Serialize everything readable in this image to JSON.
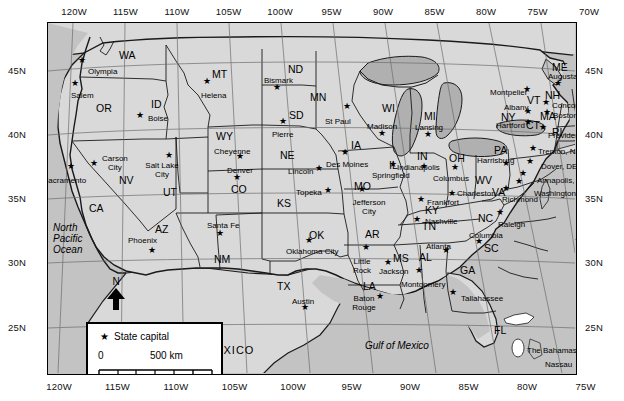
{
  "map": {
    "title": "United States state capitals map",
    "colors": {
      "land": "#d9d9d9",
      "ocean": "#c3c3c3",
      "lake": "#b0b0b0",
      "border": "#1a1a1a",
      "graticule": "#6b6b6b",
      "text": "#000000"
    },
    "axes": {
      "longitude_top": [
        "120W",
        "115W",
        "110W",
        "105W",
        "100W",
        "95W",
        "90W",
        "85W",
        "80W",
        "75W",
        "70W"
      ],
      "longitude_bottom": [
        "120W",
        "115W",
        "110W",
        "105W",
        "100W",
        "95W",
        "90W",
        "85W",
        "80W",
        "75W"
      ],
      "latitude_left": [
        "45N",
        "40N",
        "35N",
        "30N",
        "25N"
      ],
      "latitude_right": [
        "45N",
        "40N",
        "35N",
        "30N",
        "25N"
      ]
    },
    "legend": {
      "capital_label": "State capital",
      "capital_symbol": "star",
      "scale_top_start": "0",
      "scale_top_end": "500 km",
      "scale_bottom_start": "0",
      "scale_bottom_end": "500 m"
    },
    "north_arrow_label": "N",
    "water_labels": [
      {
        "name": "north-pacific-ocean",
        "text": "North\nPacific\nOcean",
        "x": 53,
        "y": 222
      },
      {
        "name": "north-atlantic-ocean",
        "text": "North\nAtlantic\nOcean",
        "x": 576,
        "y": 220
      },
      {
        "name": "gulf-of-mexico",
        "text": "Gulf of Mexico",
        "x": 365,
        "y": 341
      }
    ],
    "country_labels": [
      {
        "name": "mexico",
        "text": "MEXICO",
        "x": 205,
        "y": 345
      },
      {
        "name": "the-bahamas",
        "text": "The Bahamas",
        "x": 527,
        "y": 347
      },
      {
        "name": "nassau",
        "text": "Nassau",
        "x": 545,
        "y": 361
      }
    ],
    "state_abbreviations": [
      {
        "code": "WA",
        "x": 119,
        "y": 50
      },
      {
        "code": "OR",
        "x": 96,
        "y": 103
      },
      {
        "code": "ID",
        "x": 151,
        "y": 99
      },
      {
        "code": "MT",
        "x": 212,
        "y": 69
      },
      {
        "code": "ND",
        "x": 288,
        "y": 64
      },
      {
        "code": "SD",
        "x": 289,
        "y": 110
      },
      {
        "code": "NE",
        "x": 280,
        "y": 150
      },
      {
        "code": "WY",
        "x": 216,
        "y": 131
      },
      {
        "code": "NV",
        "x": 119,
        "y": 175
      },
      {
        "code": "UT",
        "x": 163,
        "y": 187
      },
      {
        "code": "CO",
        "x": 231,
        "y": 184
      },
      {
        "code": "KS",
        "x": 277,
        "y": 198
      },
      {
        "code": "CA",
        "x": 89,
        "y": 203
      },
      {
        "code": "AZ",
        "x": 155,
        "y": 224
      },
      {
        "code": "NM",
        "x": 214,
        "y": 254
      },
      {
        "code": "OK",
        "x": 309,
        "y": 230
      },
      {
        "code": "TX",
        "x": 277,
        "y": 281
      },
      {
        "code": "AR",
        "x": 365,
        "y": 229
      },
      {
        "code": "LA",
        "x": 363,
        "y": 281
      },
      {
        "code": "MS",
        "x": 393,
        "y": 253
      },
      {
        "code": "AL",
        "x": 419,
        "y": 252
      },
      {
        "code": "GA",
        "x": 460,
        "y": 265
      },
      {
        "code": "FL",
        "x": 494,
        "y": 325
      },
      {
        "code": "MO",
        "x": 354,
        "y": 181
      },
      {
        "code": "IA",
        "x": 351,
        "y": 140
      },
      {
        "code": "MN",
        "x": 310,
        "y": 92
      },
      {
        "code": "WI",
        "x": 382,
        "y": 103
      },
      {
        "code": "IL",
        "x": 389,
        "y": 160
      },
      {
        "code": "MI",
        "x": 424,
        "y": 111
      },
      {
        "code": "IN",
        "x": 417,
        "y": 151
      },
      {
        "code": "OH",
        "x": 449,
        "y": 153
      },
      {
        "code": "KY",
        "x": 425,
        "y": 205
      },
      {
        "code": "TN",
        "x": 422,
        "y": 221
      },
      {
        "code": "WV",
        "x": 475,
        "y": 175
      },
      {
        "code": "VA",
        "x": 492,
        "y": 187
      },
      {
        "code": "NC",
        "x": 478,
        "y": 213
      },
      {
        "code": "SC",
        "x": 484,
        "y": 243
      },
      {
        "code": "PA",
        "x": 494,
        "y": 145
      },
      {
        "code": "NY",
        "x": 501,
        "y": 112
      },
      {
        "code": "VT",
        "x": 527,
        "y": 95
      },
      {
        "code": "NH",
        "x": 545,
        "y": 90
      },
      {
        "code": "ME",
        "x": 552,
        "y": 62
      },
      {
        "code": "MA",
        "x": 540,
        "y": 111
      },
      {
        "code": "CT",
        "x": 526,
        "y": 120
      },
      {
        "code": "RI",
        "x": 552,
        "y": 127
      }
    ],
    "capitals": [
      {
        "name": "Olympia",
        "lx": 88,
        "ly": 68,
        "sx": 82,
        "sy": 60,
        "align": "left"
      },
      {
        "name": "Salem",
        "lx": 71,
        "ly": 92,
        "sx": 75,
        "sy": 83,
        "align": "left"
      },
      {
        "name": "Boise",
        "lx": 148,
        "ly": 115,
        "sx": 140,
        "sy": 115,
        "align": "left"
      },
      {
        "name": "Helena",
        "lx": 201,
        "ly": 92,
        "sx": 207,
        "sy": 81,
        "align": "left"
      },
      {
        "name": "Bismark",
        "lx": 264,
        "ly": 77,
        "sx": 277,
        "sy": 87,
        "align": "left"
      },
      {
        "name": "Pierre",
        "lx": 272,
        "ly": 131,
        "sx": 283,
        "sy": 121,
        "align": "left"
      },
      {
        "name": "Cheyenne",
        "lx": 214,
        "ly": 148,
        "sx": 240,
        "sy": 156,
        "align": "left"
      },
      {
        "name": "Denver",
        "lx": 227,
        "ly": 167,
        "sx": 237,
        "sy": 177,
        "align": "left"
      },
      {
        "name": "Salt Lake\nCity",
        "lx": 162,
        "ly": 162,
        "sx": 169,
        "sy": 155,
        "align": "center"
      },
      {
        "name": "Carson\nCity",
        "lx": 102,
        "ly": 155,
        "sx": 94,
        "sy": 163,
        "align": "left"
      },
      {
        "name": "Sacramento",
        "lx": 43,
        "ly": 177,
        "sx": 71,
        "sy": 166,
        "align": "left"
      },
      {
        "name": "Phoenix",
        "lx": 128,
        "ly": 237,
        "sx": 152,
        "sy": 250,
        "align": "left"
      },
      {
        "name": "Santa Fe",
        "lx": 207,
        "ly": 222,
        "sx": 220,
        "sy": 233,
        "align": "left"
      },
      {
        "name": "Lincoln",
        "lx": 288,
        "ly": 168,
        "sx": 319,
        "sy": 168,
        "align": "left"
      },
      {
        "name": "Topeka",
        "lx": 296,
        "ly": 189,
        "sx": 328,
        "sy": 190,
        "align": "left"
      },
      {
        "name": "Oklahoma City",
        "lx": 286,
        "ly": 248,
        "sx": 309,
        "sy": 240,
        "align": "left"
      },
      {
        "name": "Austin",
        "lx": 292,
        "ly": 298,
        "sx": 305,
        "sy": 307,
        "align": "left"
      },
      {
        "name": "St Paul",
        "lx": 325,
        "ly": 118,
        "sx": 347,
        "sy": 106,
        "align": "left"
      },
      {
        "name": "Des Moines",
        "lx": 326,
        "ly": 161,
        "sx": 345,
        "sy": 152,
        "align": "left"
      },
      {
        "name": "Jefferson\nCity",
        "lx": 369,
        "ly": 199,
        "sx": 362,
        "sy": 189,
        "align": "center"
      },
      {
        "name": "Little\nRock",
        "lx": 362,
        "ly": 258,
        "sx": 366,
        "sy": 247,
        "align": "center"
      },
      {
        "name": "Baton\nRouge",
        "lx": 364,
        "ly": 295,
        "sx": 380,
        "sy": 296,
        "align": "center"
      },
      {
        "name": "Jackson",
        "lx": 379,
        "ly": 268,
        "sx": 388,
        "sy": 262,
        "align": "left"
      },
      {
        "name": "Montgomery",
        "lx": 401,
        "ly": 281,
        "sx": 419,
        "sy": 270,
        "align": "left"
      },
      {
        "name": "Tallahassee",
        "lx": 461,
        "ly": 295,
        "sx": 453,
        "sy": 292,
        "align": "left"
      },
      {
        "name": "Atlanta",
        "lx": 426,
        "ly": 243,
        "sx": 446,
        "sy": 250,
        "align": "left"
      },
      {
        "name": "Columbia",
        "lx": 469,
        "ly": 232,
        "sx": 479,
        "sy": 241,
        "align": "left"
      },
      {
        "name": "Nashville",
        "lx": 425,
        "ly": 218,
        "sx": 417,
        "sy": 219,
        "align": "left"
      },
      {
        "name": "Frankfort",
        "lx": 427,
        "ly": 199,
        "sx": 421,
        "sy": 199,
        "align": "left"
      },
      {
        "name": "Madison",
        "lx": 367,
        "ly": 123,
        "sx": 382,
        "sy": 133,
        "align": "left"
      },
      {
        "name": "Lansing",
        "lx": 415,
        "ly": 124,
        "sx": 428,
        "sy": 134,
        "align": "left"
      },
      {
        "name": "Springfield",
        "lx": 372,
        "ly": 172,
        "sx": 393,
        "sy": 164,
        "align": "left"
      },
      {
        "name": "Indianapolis",
        "lx": 397,
        "ly": 164,
        "sx": 424,
        "sy": 166,
        "align": "left"
      },
      {
        "name": "Columbus",
        "lx": 433,
        "ly": 175,
        "sx": 455,
        "sy": 167,
        "align": "left"
      },
      {
        "name": "Charleston",
        "lx": 457,
        "ly": 190,
        "sx": 452,
        "sy": 193,
        "align": "left"
      },
      {
        "name": "Raleigh",
        "lx": 498,
        "ly": 221,
        "sx": 500,
        "sy": 212,
        "align": "left"
      },
      {
        "name": "Richmond",
        "lx": 502,
        "ly": 196,
        "sx": 506,
        "sy": 188,
        "align": "left"
      },
      {
        "name": "Harrisburg",
        "lx": 477,
        "ly": 157,
        "sx": 506,
        "sy": 163,
        "align": "left"
      },
      {
        "name": "Albany",
        "lx": 504,
        "ly": 104,
        "sx": 528,
        "sy": 111,
        "align": "left"
      },
      {
        "name": "Hartford",
        "lx": 496,
        "ly": 122,
        "sx": 528,
        "sy": 122,
        "align": "left"
      },
      {
        "name": "Montpelier",
        "lx": 490,
        "ly": 89,
        "sx": 527,
        "sy": 89,
        "align": "left"
      },
      {
        "name": "Concord",
        "lx": 552,
        "ly": 102,
        "sx": 546,
        "sy": 102,
        "align": "left"
      },
      {
        "name": "Boston",
        "lx": 553,
        "ly": 112,
        "sx": 547,
        "sy": 112,
        "align": "left"
      },
      {
        "name": "Augusta",
        "lx": 548,
        "ly": 73,
        "sx": 558,
        "sy": 83,
        "align": "left"
      },
      {
        "name": "Providence",
        "lx": 548,
        "ly": 132,
        "sx": 543,
        "sy": 127,
        "align": "left"
      },
      {
        "name": "Trenton, NJ",
        "lx": 538,
        "ly": 148,
        "sx": 533,
        "sy": 148,
        "align": "left"
      },
      {
        "name": "Dover, DE",
        "lx": 541,
        "ly": 163,
        "sx": 530,
        "sy": 161,
        "align": "left"
      },
      {
        "name": "Annapolis, MD",
        "lx": 537,
        "ly": 177,
        "sx": 523,
        "sy": 173,
        "align": "left"
      },
      {
        "name": "Washington, D.C",
        "lx": 534,
        "ly": 190,
        "sx": 519,
        "sy": 181,
        "align": "left"
      }
    ]
  }
}
